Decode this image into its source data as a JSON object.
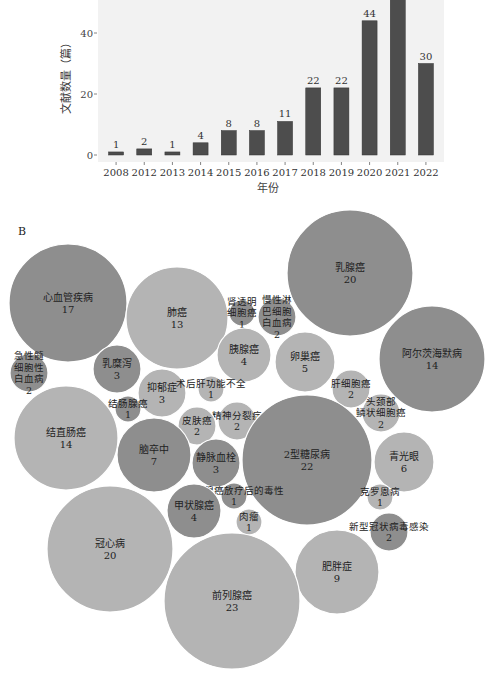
{
  "chart_data": [
    {
      "type": "bar",
      "panel": "A",
      "title": "",
      "xlabel": "年份",
      "ylabel": "文献数量（篇）",
      "categories": [
        "2008",
        "2012",
        "2013",
        "2014",
        "2015",
        "2016",
        "2017",
        "2018",
        "2019",
        "2020",
        "2021",
        "2022"
      ],
      "values": [
        1,
        2,
        1,
        4,
        8,
        8,
        11,
        22,
        22,
        44,
        null,
        30
      ],
      "value_labels": [
        "1",
        "2",
        "1",
        "4",
        "8",
        "8",
        "11",
        "22",
        "22",
        "44",
        "",
        "30"
      ],
      "note": "2021 bar exceeds visible crop; its label is cut off",
      "yticks": [
        0,
        20,
        40
      ],
      "ylim": [
        0,
        52
      ],
      "grid": false,
      "background": "#f2f2f2",
      "bar_color": "#4d4d4d"
    },
    {
      "type": "bubble",
      "panel": "B",
      "title": "B",
      "bubbles": [
        {
          "label": "心血管疾病",
          "value": 17,
          "cx": 68,
          "cy": 108,
          "r": 59,
          "shade": "dark"
        },
        {
          "label": "肺癌",
          "value": 13,
          "cx": 177,
          "cy": 123,
          "r": 51,
          "shade": "light"
        },
        {
          "label": "肾透明细胞癌",
          "lines": [
            "肾透明",
            "细胞癌"
          ],
          "value": 1,
          "cx": 242,
          "cy": 118,
          "r": 13,
          "shade": "dark"
        },
        {
          "label": "慢性淋巴细胞白血病",
          "lines": [
            "慢性淋",
            "巴细胞",
            "白血病"
          ],
          "value": 2,
          "cx": 277,
          "cy": 122,
          "r": 19,
          "shade": "dark"
        },
        {
          "label": "乳腺癌",
          "value": 20,
          "cx": 350,
          "cy": 78,
          "r": 63,
          "shade": "dark"
        },
        {
          "label": "急性髓细胞性白血病",
          "lines": [
            "急性髓",
            "细胞性",
            "白血病"
          ],
          "value": 2,
          "cx": 29,
          "cy": 178,
          "r": 19,
          "shade": "dark"
        },
        {
          "label": "乳糜泻",
          "value": 3,
          "cx": 117,
          "cy": 174,
          "r": 24,
          "shade": "dark"
        },
        {
          "label": "胰腺癌",
          "value": 4,
          "cx": 244,
          "cy": 160,
          "r": 27,
          "shade": "light"
        },
        {
          "label": "卵巢癌",
          "value": 5,
          "cx": 305,
          "cy": 167,
          "r": 30,
          "shade": "light"
        },
        {
          "label": "阿尔茨海默病",
          "value": 14,
          "cx": 432,
          "cy": 164,
          "r": 53,
          "shade": "dark"
        },
        {
          "label": "抑郁症",
          "value": 3,
          "cx": 162,
          "cy": 198,
          "r": 24,
          "shade": "light"
        },
        {
          "label": "术后肝功能不全",
          "value": 1,
          "cx": 211,
          "cy": 194,
          "r": 13,
          "shade": "light"
        },
        {
          "label": "肝细胞癌",
          "value": 2,
          "cx": 351,
          "cy": 194,
          "r": 19,
          "shade": "light"
        },
        {
          "label": "结肠腺癌",
          "value": 1,
          "cx": 128,
          "cy": 214,
          "r": 13,
          "shade": "dark"
        },
        {
          "label": "精神分裂症",
          "value": 2,
          "cx": 237,
          "cy": 226,
          "r": 19,
          "shade": "light"
        },
        {
          "label": "皮肤癌",
          "value": 2,
          "cx": 197,
          "cy": 231,
          "r": 19,
          "shade": "light"
        },
        {
          "label": "头颈部鳞状细胞癌",
          "lines": [
            "头颈部",
            "鳞状细胞癌"
          ],
          "value": 2,
          "cx": 381,
          "cy": 218,
          "r": 19,
          "shade": "light"
        },
        {
          "label": "结直肠癌",
          "value": 14,
          "cx": 66,
          "cy": 243,
          "r": 52,
          "shade": "light"
        },
        {
          "label": "脑卒中",
          "value": 7,
          "cx": 154,
          "cy": 260,
          "r": 37,
          "shade": "dark"
        },
        {
          "label": "静脉血栓",
          "value": 3,
          "cx": 216,
          "cy": 268,
          "r": 24,
          "shade": "dark"
        },
        {
          "label": "2型糖尿病",
          "value": 22,
          "cx": 307,
          "cy": 265,
          "r": 65,
          "shade": "dark"
        },
        {
          "label": "青光眼",
          "value": 6,
          "cx": 404,
          "cy": 267,
          "r": 30,
          "shade": "light"
        },
        {
          "label": "前列腺癌放疗后的毒性",
          "value": 1,
          "cx": 234,
          "cy": 301,
          "r": 13,
          "shade": "dark"
        },
        {
          "label": "甲状腺癌",
          "value": 4,
          "cx": 194,
          "cy": 316,
          "r": 27,
          "shade": "dark"
        },
        {
          "label": "肉瘤",
          "value": 1,
          "cx": 249,
          "cy": 327,
          "r": 13,
          "shade": "light"
        },
        {
          "label": "克罗恩病",
          "value": 1,
          "cx": 380,
          "cy": 302,
          "r": 13,
          "shade": "light"
        },
        {
          "label": "新型冠状病毒感染",
          "value": 2,
          "cx": 389,
          "cy": 337,
          "r": 19,
          "shade": "dark"
        },
        {
          "label": "冠心病",
          "value": 20,
          "cx": 110,
          "cy": 354,
          "r": 63,
          "shade": "light"
        },
        {
          "label": "肥胖症",
          "value": 9,
          "cx": 337,
          "cy": 377,
          "r": 42,
          "shade": "light"
        },
        {
          "label": "前列腺癌",
          "value": 23,
          "cx": 232,
          "cy": 406,
          "r": 68,
          "shade": "light"
        }
      ],
      "colors": {
        "dark": "#8e8e8e",
        "light": "#b4b4b4"
      }
    }
  ]
}
